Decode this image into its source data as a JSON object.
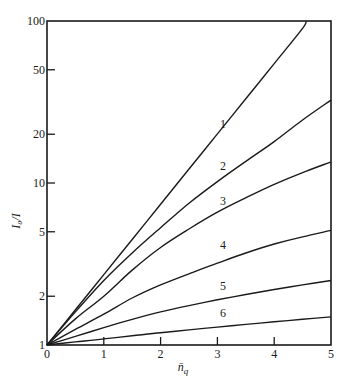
{
  "chart_data": {
    "type": "line",
    "title": "",
    "xlabel": "n̄_q",
    "ylabel": "I₀/I",
    "xscale": "linear",
    "yscale": "log",
    "xlim": [
      0,
      5
    ],
    "ylim": [
      1,
      100
    ],
    "grid": false,
    "legend": "inline curve labels",
    "x_ticks": [
      0,
      1,
      2,
      3,
      4,
      5
    ],
    "x_tick_labels": [
      "0",
      "1",
      "2",
      "3",
      "4",
      "5"
    ],
    "y_ticks": [
      1,
      2,
      5,
      10,
      20,
      50,
      100
    ],
    "y_tick_labels": [
      "1",
      "2",
      "5",
      "10",
      "20",
      "50",
      "100"
    ],
    "x": [
      0,
      0.5,
      1,
      1.5,
      2,
      2.5,
      3,
      3.5,
      4,
      4.5,
      5
    ],
    "series": [
      {
        "name": "1",
        "values": [
          1,
          1.65,
          2.72,
          4.48,
          7.39,
          12.2,
          20.1,
          33.1,
          54.6,
          90.0,
          null
        ],
        "end_point": [
          4.56,
          100
        ]
      },
      {
        "name": "2",
        "values": [
          1,
          1.6,
          2.5,
          3.7,
          5.3,
          7.5,
          10.2,
          13.6,
          18.0,
          24.5,
          32.5
        ]
      },
      {
        "name": "3",
        "values": [
          1,
          1.45,
          2.0,
          2.9,
          4.0,
          5.2,
          6.6,
          8.1,
          9.8,
          11.6,
          13.5
        ]
      },
      {
        "name": "4",
        "values": [
          1,
          1.25,
          1.55,
          1.95,
          2.35,
          2.75,
          3.2,
          3.7,
          4.2,
          4.65,
          5.1
        ]
      },
      {
        "name": "5",
        "values": [
          1,
          1.13,
          1.28,
          1.44,
          1.6,
          1.75,
          1.9,
          2.05,
          2.2,
          2.35,
          2.5
        ]
      },
      {
        "name": "6",
        "values": [
          1,
          1.045,
          1.09,
          1.14,
          1.19,
          1.24,
          1.29,
          1.34,
          1.39,
          1.44,
          1.49
        ]
      }
    ],
    "curve_label_positions": [
      {
        "name": "1",
        "x": 3.1,
        "y": 22
      },
      {
        "name": "2",
        "x": 3.1,
        "y": 12
      },
      {
        "name": "3",
        "x": 3.1,
        "y": 7.3
      },
      {
        "name": "4",
        "x": 3.1,
        "y": 3.9
      },
      {
        "name": "5",
        "x": 3.1,
        "y": 2.2
      },
      {
        "name": "6",
        "x": 3.1,
        "y": 1.48
      }
    ]
  }
}
